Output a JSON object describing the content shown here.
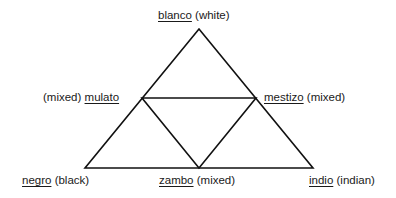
{
  "diagram": {
    "type": "triangle",
    "line_color": "#111111",
    "vertices": {
      "top": {
        "term": "blanco",
        "gloss": "(white)"
      },
      "bottom_left": {
        "term": "negro",
        "gloss": "(black)"
      },
      "bottom_right": {
        "term": "indio",
        "gloss": "(indian)"
      }
    },
    "midpoints": {
      "left": {
        "prefix": "(mixed)",
        "term": "mulato"
      },
      "right": {
        "term": "mestizo",
        "gloss": "(mixed)"
      },
      "bottom": {
        "term": "zambo",
        "gloss": "(mixed)"
      }
    }
  }
}
